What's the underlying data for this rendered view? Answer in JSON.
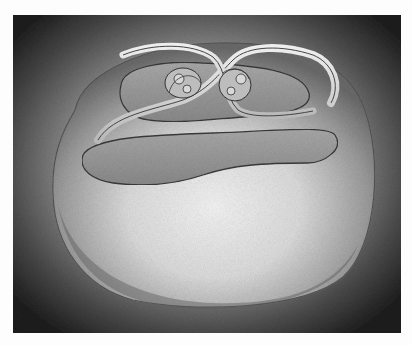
{
  "artwork": {
    "description": "Pencil drawing of a smooth blob-like torus shape with a recursive looping band containing smaller self-similar copies",
    "palette": {
      "background_dark": "#1c1c1c",
      "paper": "#fdfdfd",
      "surface_light": "#f2f2f2",
      "surface_mid": "#9a9a9a",
      "recess": "#8e8e8e"
    }
  }
}
